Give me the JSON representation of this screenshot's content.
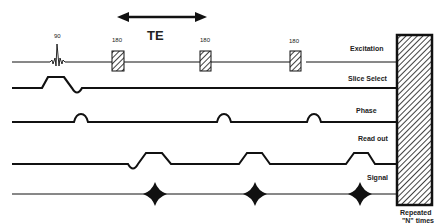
{
  "diagram": {
    "te_label": "TE",
    "pulses": {
      "excitation_angle": "90",
      "refocus_angles": [
        "180",
        "180",
        "180"
      ]
    },
    "rows": [
      {
        "id": "excitation",
        "label": "Excitation"
      },
      {
        "id": "slice-select",
        "label": "Slice Select"
      },
      {
        "id": "phase",
        "label": "Phase"
      },
      {
        "id": "read-out",
        "label": "Read out"
      },
      {
        "id": "signal",
        "label": "Signal"
      }
    ],
    "repeat_block": {
      "label_line1": "Repeated",
      "label_line2": "\"N\" times"
    },
    "colors": {
      "line": "#111111",
      "background": "#ffffff"
    }
  }
}
